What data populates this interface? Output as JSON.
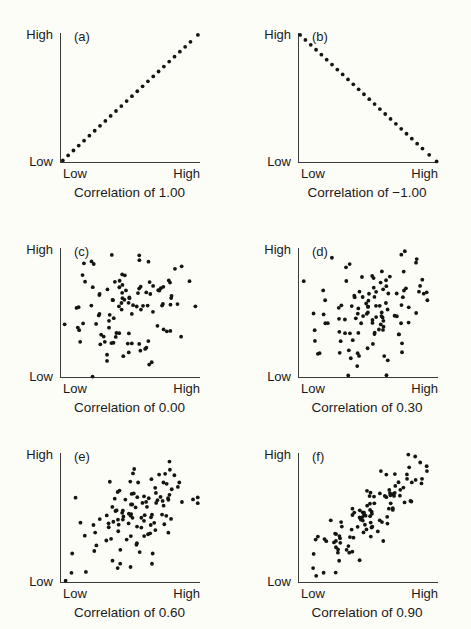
{
  "figure": {
    "axis_labels": {
      "y_top": "High",
      "y_bottom": "Low",
      "x_left": "Low",
      "x_right": "High"
    }
  },
  "chart_data": [
    {
      "type": "scatter",
      "panel": "(a)",
      "title": "Correlation of 1.00",
      "r": 1.0,
      "xlabel": "",
      "ylabel": "",
      "xlim": [
        0,
        1
      ],
      "ylim": [
        0,
        1
      ],
      "xticklabels": [
        "Low",
        "High"
      ],
      "yticklabels": [
        "Low",
        "High"
      ],
      "grid": false,
      "legend": false,
      "n": 26,
      "points": [
        [
          0.02,
          0.02
        ],
        [
          0.058,
          0.058
        ],
        [
          0.096,
          0.096
        ],
        [
          0.134,
          0.134
        ],
        [
          0.172,
          0.172
        ],
        [
          0.21,
          0.21
        ],
        [
          0.248,
          0.248
        ],
        [
          0.286,
          0.286
        ],
        [
          0.324,
          0.324
        ],
        [
          0.362,
          0.362
        ],
        [
          0.4,
          0.4
        ],
        [
          0.438,
          0.438
        ],
        [
          0.476,
          0.476
        ],
        [
          0.514,
          0.514
        ],
        [
          0.552,
          0.552
        ],
        [
          0.59,
          0.59
        ],
        [
          0.628,
          0.628
        ],
        [
          0.666,
          0.666
        ],
        [
          0.704,
          0.704
        ],
        [
          0.742,
          0.742
        ],
        [
          0.78,
          0.78
        ],
        [
          0.818,
          0.818
        ],
        [
          0.856,
          0.856
        ],
        [
          0.894,
          0.894
        ],
        [
          0.932,
          0.932
        ],
        [
          0.985,
          0.985
        ]
      ]
    },
    {
      "type": "scatter",
      "panel": "(b)",
      "title": "Correlation of −1.00",
      "r": -1.0,
      "xlabel": "",
      "ylabel": "",
      "xlim": [
        0,
        1
      ],
      "ylim": [
        0,
        1
      ],
      "xticklabels": [
        "Low",
        "High"
      ],
      "yticklabels": [
        "Low",
        "High"
      ],
      "grid": false,
      "legend": false,
      "n": 26,
      "points": [
        [
          0.015,
          0.985
        ],
        [
          0.053,
          0.947
        ],
        [
          0.091,
          0.909
        ],
        [
          0.129,
          0.871
        ],
        [
          0.167,
          0.833
        ],
        [
          0.205,
          0.795
        ],
        [
          0.243,
          0.757
        ],
        [
          0.281,
          0.719
        ],
        [
          0.319,
          0.681
        ],
        [
          0.357,
          0.643
        ],
        [
          0.395,
          0.605
        ],
        [
          0.433,
          0.567
        ],
        [
          0.471,
          0.529
        ],
        [
          0.509,
          0.491
        ],
        [
          0.547,
          0.453
        ],
        [
          0.585,
          0.415
        ],
        [
          0.623,
          0.377
        ],
        [
          0.661,
          0.339
        ],
        [
          0.699,
          0.301
        ],
        [
          0.737,
          0.263
        ],
        [
          0.775,
          0.225
        ],
        [
          0.813,
          0.187
        ],
        [
          0.851,
          0.149
        ],
        [
          0.889,
          0.111
        ],
        [
          0.937,
          0.063
        ],
        [
          0.99,
          0.012
        ]
      ]
    },
    {
      "type": "scatter",
      "panel": "(c)",
      "title": "Correlation of 0.00",
      "r": 0.0,
      "xlabel": "",
      "ylabel": "",
      "xlim": [
        0,
        1
      ],
      "ylim": [
        0,
        1
      ],
      "xticklabels": [
        "Low",
        "High"
      ],
      "yticklabels": [
        "Low",
        "High"
      ],
      "grid": false,
      "legend": false,
      "n": 105,
      "seed": 17
    },
    {
      "type": "scatter",
      "panel": "(d)",
      "title": "Correlation of 0.30",
      "r": 0.3,
      "xlabel": "",
      "ylabel": "",
      "xlim": [
        0,
        1
      ],
      "ylim": [
        0,
        1
      ],
      "xticklabels": [
        "Low",
        "High"
      ],
      "yticklabels": [
        "Low",
        "High"
      ],
      "grid": false,
      "legend": false,
      "n": 110,
      "seed": 43
    },
    {
      "type": "scatter",
      "panel": "(e)",
      "title": "Correlation of 0.60",
      "r": 0.6,
      "xlabel": "",
      "ylabel": "",
      "xlim": [
        0,
        1
      ],
      "ylim": [
        0,
        1
      ],
      "xticklabels": [
        "Low",
        "High"
      ],
      "yticklabels": [
        "Low",
        "High"
      ],
      "grid": false,
      "legend": false,
      "n": 108,
      "seed": 91
    },
    {
      "type": "scatter",
      "panel": "(f)",
      "title": "Correlation of 0.90",
      "r": 0.9,
      "xlabel": "",
      "ylabel": "",
      "xlim": [
        0,
        1
      ],
      "ylim": [
        0,
        1
      ],
      "xticklabels": [
        "Low",
        "High"
      ],
      "yticklabels": [
        "Low",
        "High"
      ],
      "grid": false,
      "legend": false,
      "n": 104,
      "seed": 5
    }
  ]
}
